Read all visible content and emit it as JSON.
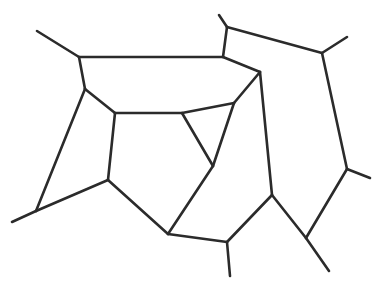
{
  "diagram": {
    "type": "planar-graph-line-drawing",
    "stroke_color": "#2b2b2b",
    "background": "#ffffff",
    "vertices": {
      "A": [
        37,
        31
      ],
      "B": [
        79,
        57
      ],
      "C": [
        85,
        89
      ],
      "D": [
        115,
        113
      ],
      "E": [
        182,
        113
      ],
      "F": [
        219,
        15
      ],
      "G": [
        227,
        27
      ],
      "H": [
        223,
        57
      ],
      "I": [
        260,
        72
      ],
      "J": [
        322,
        53
      ],
      "K": [
        347,
        37
      ],
      "L": [
        234,
        103
      ],
      "M": [
        12,
        222
      ],
      "N": [
        36,
        211
      ],
      "O": [
        108,
        180
      ],
      "P": [
        168,
        234
      ],
      "Q": [
        213,
        166
      ],
      "R": [
        272,
        195
      ],
      "S": [
        227,
        242
      ],
      "T": [
        230,
        276
      ],
      "U": [
        306,
        238
      ],
      "V": [
        329,
        271
      ],
      "W": [
        347,
        169
      ],
      "X": [
        370,
        178
      ]
    },
    "edges": [
      [
        "A",
        "B"
      ],
      [
        "B",
        "H"
      ],
      [
        "H",
        "G"
      ],
      [
        "G",
        "F"
      ],
      [
        "G",
        "J"
      ],
      [
        "J",
        "K"
      ],
      [
        "J",
        "W"
      ],
      [
        "W",
        "X"
      ],
      [
        "W",
        "U"
      ],
      [
        "U",
        "V"
      ],
      [
        "U",
        "R"
      ],
      [
        "R",
        "I"
      ],
      [
        "H",
        "I"
      ],
      [
        "I",
        "L"
      ],
      [
        "L",
        "Q"
      ],
      [
        "L",
        "E"
      ],
      [
        "E",
        "Q"
      ],
      [
        "Q",
        "P"
      ],
      [
        "P",
        "S"
      ],
      [
        "S",
        "T"
      ],
      [
        "S",
        "R"
      ],
      [
        "B",
        "C"
      ],
      [
        "C",
        "D"
      ],
      [
        "C",
        "N"
      ],
      [
        "D",
        "E"
      ],
      [
        "D",
        "O"
      ],
      [
        "O",
        "N"
      ],
      [
        "N",
        "M"
      ],
      [
        "O",
        "P"
      ]
    ]
  }
}
